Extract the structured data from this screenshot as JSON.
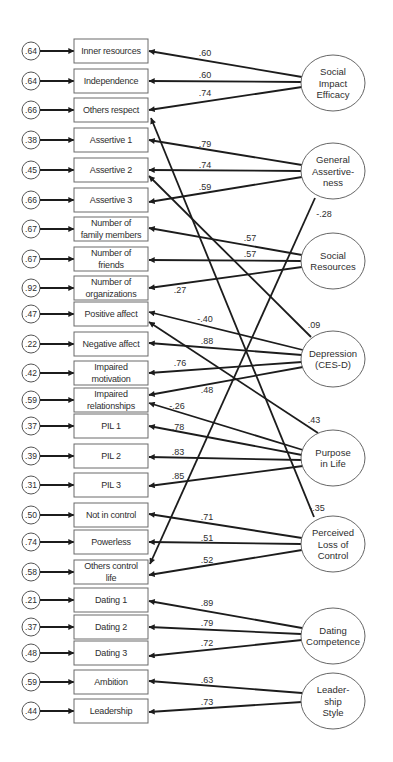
{
  "diagram": {
    "type": "structural-equation-path-diagram",
    "style": {
      "box_x": 74,
      "box_w": 74,
      "box_h": 24,
      "err_cx": 31,
      "err_r": 9,
      "latent_rx": 32,
      "latent_ry": 28,
      "line_color": "#1c1c1c",
      "text_color": "#2e2e2e"
    },
    "indicators": [
      {
        "id": "inner-resources",
        "label": [
          "Inner resources"
        ],
        "error": ".64",
        "y": 39
      },
      {
        "id": "independence",
        "label": [
          "Independence"
        ],
        "error": ".64",
        "y": 69
      },
      {
        "id": "others-respect",
        "label": [
          "Others respect"
        ],
        "error": ".66",
        "y": 98
      },
      {
        "id": "assertive-1",
        "label": [
          "Assertive 1"
        ],
        "error": ".38",
        "y": 128
      },
      {
        "id": "assertive-2",
        "label": [
          "Assertive 2"
        ],
        "error": ".45",
        "y": 158
      },
      {
        "id": "assertive-3",
        "label": [
          "Assertive 3"
        ],
        "error": ".66",
        "y": 188
      },
      {
        "id": "number-of-family-members",
        "label": [
          "Number of",
          "family members"
        ],
        "error": ".67",
        "y": 217
      },
      {
        "id": "number-of-friends",
        "label": [
          "Number of",
          "friends"
        ],
        "error": ".67",
        "y": 247
      },
      {
        "id": "number-of-organizations",
        "label": [
          "Number of",
          "organizations"
        ],
        "error": ".92",
        "y": 276
      },
      {
        "id": "positive-affect",
        "label": [
          "Positive affect"
        ],
        "error": ".47",
        "y": 302
      },
      {
        "id": "negative-affect",
        "label": [
          "Negative affect"
        ],
        "error": ".22",
        "y": 332
      },
      {
        "id": "impaired-motivation",
        "label": [
          "Impaired",
          "motivation"
        ],
        "error": ".42",
        "y": 361
      },
      {
        "id": "impaired-relationships",
        "label": [
          "Impaired",
          "relationships"
        ],
        "error": ".59",
        "y": 388
      },
      {
        "id": "pil-1",
        "label": [
          "PIL 1"
        ],
        "error": ".37",
        "y": 414
      },
      {
        "id": "pil-2",
        "label": [
          "PIL 2"
        ],
        "error": ".39",
        "y": 444
      },
      {
        "id": "pil-3",
        "label": [
          "PIL 3"
        ],
        "error": ".31",
        "y": 473
      },
      {
        "id": "not-in-control",
        "label": [
          "Not in control"
        ],
        "error": ".50",
        "y": 503
      },
      {
        "id": "powerless",
        "label": [
          "Powerless"
        ],
        "error": ".74",
        "y": 530
      },
      {
        "id": "others-control-life",
        "label": [
          "Others control",
          "life"
        ],
        "error": ".58",
        "y": 560
      },
      {
        "id": "dating-1",
        "label": [
          "Dating 1"
        ],
        "error": ".21",
        "y": 588
      },
      {
        "id": "dating-2",
        "label": [
          "Dating 2"
        ],
        "error": ".37",
        "y": 615
      },
      {
        "id": "dating-3",
        "label": [
          "Dating 3"
        ],
        "error": ".48",
        "y": 641
      },
      {
        "id": "ambition",
        "label": [
          "Ambition"
        ],
        "error": ".59",
        "y": 670
      },
      {
        "id": "leadership",
        "label": [
          "Leadership"
        ],
        "error": ".44",
        "y": 699
      }
    ],
    "latents": [
      {
        "id": "social-impact-efficacy",
        "label": [
          "Social",
          "Impact",
          "Efficacy"
        ],
        "cx": 333,
        "cy": 83
      },
      {
        "id": "general-assertiveness",
        "label": [
          "General",
          "Assertive-",
          "ness"
        ],
        "cx": 333,
        "cy": 171
      },
      {
        "id": "social-resources",
        "label": [
          "Social",
          "Resources"
        ],
        "cx": 333,
        "cy": 261
      },
      {
        "id": "depression-ces-d",
        "label": [
          "Depression",
          "(CES-D)"
        ],
        "cx": 333,
        "cy": 359
      },
      {
        "id": "purpose-in-life",
        "label": [
          "Purpose",
          "in Life"
        ],
        "cx": 333,
        "cy": 458
      },
      {
        "id": "perceived-loss-of-control",
        "label": [
          "Perceived",
          "Loss of",
          "Control"
        ],
        "cx": 333,
        "cy": 544
      },
      {
        "id": "dating-competence",
        "label": [
          "Dating",
          "Competence"
        ],
        "cx": 333,
        "cy": 636
      },
      {
        "id": "leadership-style",
        "label": [
          "Leader-",
          "ship",
          "Style"
        ],
        "cx": 333,
        "cy": 701
      }
    ],
    "paths": [
      {
        "from": "social-impact-efficacy",
        "to": "inner-resources",
        "coef": ".60",
        "x1": 302,
        "y1": 77,
        "x2": 149,
        "y2": 51,
        "lx": 205,
        "ly": 56
      },
      {
        "from": "social-impact-efficacy",
        "to": "independence",
        "coef": ".60",
        "x1": 301,
        "y1": 82,
        "x2": 149,
        "y2": 81,
        "lx": 205,
        "ly": 78
      },
      {
        "from": "social-impact-efficacy",
        "to": "others-respect",
        "coef": ".74",
        "x1": 302,
        "y1": 87,
        "x2": 149,
        "y2": 110,
        "lx": 205,
        "ly": 96
      },
      {
        "from": "general-assertiveness",
        "to": "assertive-1",
        "coef": ".79",
        "x1": 302,
        "y1": 165,
        "x2": 149,
        "y2": 140,
        "lx": 205,
        "ly": 147
      },
      {
        "from": "general-assertiveness",
        "to": "assertive-2",
        "coef": ".74",
        "x1": 301,
        "y1": 171,
        "x2": 149,
        "y2": 170,
        "lx": 205,
        "ly": 168
      },
      {
        "from": "general-assertiveness",
        "to": "assertive-3",
        "coef": ".59",
        "x1": 302,
        "y1": 177,
        "x2": 149,
        "y2": 202,
        "lx": 205,
        "ly": 190
      },
      {
        "from": "general-assertiveness",
        "to": "others-control-life",
        "coef": "-.28",
        "x1": 315,
        "y1": 198,
        "x2": 150,
        "y2": 564,
        "lx": 324,
        "ly": 217
      },
      {
        "from": "social-resources",
        "to": "number-of-family-members",
        "coef": ".57",
        "x1": 302,
        "y1": 255,
        "x2": 149,
        "y2": 228,
        "lx": 250,
        "ly": 241
      },
      {
        "from": "social-resources",
        "to": "number-of-friends",
        "coef": ".57",
        "x1": 301,
        "y1": 261,
        "x2": 149,
        "y2": 260,
        "lx": 250,
        "ly": 257
      },
      {
        "from": "social-resources",
        "to": "number-of-organizations",
        "coef": ".27",
        "x1": 302,
        "y1": 267,
        "x2": 149,
        "y2": 288,
        "lx": 180,
        "ly": 293
      },
      {
        "from": "depression-ces-d",
        "to": "positive-affect",
        "coef": "-.40",
        "x1": 303,
        "y1": 350,
        "x2": 149,
        "y2": 312,
        "lx": 205,
        "ly": 322
      },
      {
        "from": "depression-ces-d",
        "to": "negative-affect",
        "coef": ".88",
        "x1": 302,
        "y1": 355,
        "x2": 149,
        "y2": 343,
        "lx": 207,
        "ly": 344
      },
      {
        "from": "depression-ces-d",
        "to": "impaired-motivation",
        "coef": ".76",
        "x1": 302,
        "y1": 362,
        "x2": 149,
        "y2": 373,
        "lx": 180,
        "ly": 366
      },
      {
        "from": "depression-ces-d",
        "to": "impaired-relationships",
        "coef": ".48",
        "x1": 303,
        "y1": 367,
        "x2": 149,
        "y2": 395,
        "lx": 207,
        "ly": 393
      },
      {
        "from": "depression-ces-d",
        "to": "assertive-2",
        "coef": ".09",
        "x1": 311,
        "y1": 337,
        "x2": 149,
        "y2": 176,
        "lx": 314,
        "ly": 328
      },
      {
        "from": "purpose-in-life",
        "to": "impaired-relationships",
        "coef": "-.26",
        "x1": 303,
        "y1": 450,
        "x2": 149,
        "y2": 403,
        "lx": 177,
        "ly": 409
      },
      {
        "from": "purpose-in-life",
        "to": "pil-1",
        "coef": ".78",
        "x1": 302,
        "y1": 455,
        "x2": 149,
        "y2": 426,
        "lx": 178,
        "ly": 430
      },
      {
        "from": "purpose-in-life",
        "to": "pil-2",
        "coef": ".83",
        "x1": 302,
        "y1": 460,
        "x2": 149,
        "y2": 457,
        "lx": 178,
        "ly": 455
      },
      {
        "from": "purpose-in-life",
        "to": "pil-3",
        "coef": ".85",
        "x1": 303,
        "y1": 466,
        "x2": 149,
        "y2": 486,
        "lx": 178,
        "ly": 479
      },
      {
        "from": "purpose-in-life",
        "to": "positive-affect",
        "coef": ".43",
        "x1": 318,
        "y1": 433,
        "x2": 149,
        "y2": 322,
        "lx": 314,
        "ly": 423
      },
      {
        "from": "perceived-loss-of-control",
        "to": "not-in-control",
        "coef": ".71",
        "x1": 302,
        "y1": 538,
        "x2": 149,
        "y2": 514,
        "lx": 207,
        "ly": 520
      },
      {
        "from": "perceived-loss-of-control",
        "to": "powerless",
        "coef": ".51",
        "x1": 301,
        "y1": 544,
        "x2": 149,
        "y2": 542,
        "lx": 207,
        "ly": 541
      },
      {
        "from": "perceived-loss-of-control",
        "to": "others-control-life",
        "coef": ".52",
        "x1": 302,
        "y1": 550,
        "x2": 149,
        "y2": 575,
        "lx": 207,
        "ly": 563
      },
      {
        "from": "perceived-loss-of-control",
        "to": "others-respect",
        "coef": "-.35",
        "x1": 314,
        "y1": 517,
        "x2": 151,
        "y2": 118,
        "lx": 317,
        "ly": 511
      },
      {
        "from": "dating-competence",
        "to": "dating-1",
        "coef": ".89",
        "x1": 302,
        "y1": 628,
        "x2": 149,
        "y2": 601,
        "lx": 207,
        "ly": 606
      },
      {
        "from": "dating-competence",
        "to": "dating-2",
        "coef": ".79",
        "x1": 301,
        "y1": 634,
        "x2": 149,
        "y2": 627,
        "lx": 207,
        "ly": 626
      },
      {
        "from": "dating-competence",
        "to": "dating-3",
        "coef": ".72",
        "x1": 302,
        "y1": 640,
        "x2": 149,
        "y2": 656,
        "lx": 207,
        "ly": 646
      },
      {
        "from": "leadership-style",
        "to": "ambition",
        "coef": ".63",
        "x1": 302,
        "y1": 693,
        "x2": 149,
        "y2": 681,
        "lx": 207,
        "ly": 683
      },
      {
        "from": "leadership-style",
        "to": "leadership",
        "coef": ".73",
        "x1": 302,
        "y1": 702,
        "x2": 149,
        "y2": 712,
        "lx": 207,
        "ly": 705
      }
    ]
  }
}
